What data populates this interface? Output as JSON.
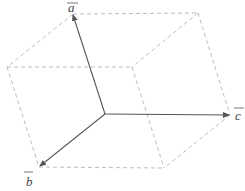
{
  "diagram": {
    "type": "parallelepiped-vectors",
    "labels": {
      "a": "a",
      "b": "b",
      "c": "c"
    },
    "colors": {
      "vector": "#555555",
      "edge": "#bdbdbd",
      "label": "#444444"
    },
    "origin": [
      105,
      114
    ],
    "vectors": [
      {
        "name": "a",
        "tip": [
          73,
          14
        ]
      },
      {
        "name": "b",
        "tip": [
          39,
          167
        ]
      },
      {
        "name": "c",
        "tip": [
          230,
          115
        ]
      }
    ],
    "vertices": {
      "a_plus_b": [
        7,
        67
      ],
      "a_plus_c": [
        198,
        13
      ],
      "a_plus_b_plus_c": [
        132,
        67
      ],
      "b_plus_c": [
        164,
        168
      ]
    }
  }
}
